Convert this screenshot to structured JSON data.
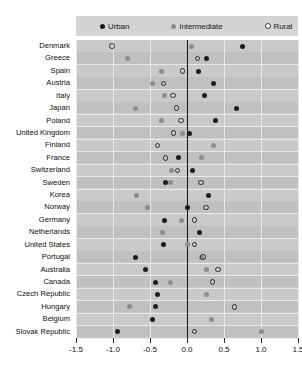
{
  "legend": {
    "items": [
      {
        "label": "Urban",
        "marker": "filled-dark-circle",
        "color": "#1a1a1a"
      },
      {
        "label": "Intermediate",
        "marker": "filled-gray-circle",
        "color": "#8f8f8f"
      },
      {
        "label": "Rural",
        "marker": "open-circle",
        "color": "#ffffff"
      }
    ]
  },
  "chart_data": {
    "type": "scatter",
    "title": "",
    "subtitle": "",
    "xlabel": "",
    "ylabel": "",
    "xlim": [
      -1.5,
      1.5
    ],
    "xticks": [
      -1.5,
      -1.0,
      -0.5,
      0.0,
      0.5,
      1.0,
      1.5
    ],
    "xticklabels": [
      "-1.5",
      "-1.0",
      "-0.5",
      "0.0",
      "0.5",
      "1.0",
      "1.5"
    ],
    "grid": true,
    "legend_position": "top",
    "zero_reference_line": 0.0,
    "categories": [
      "Denmark",
      "Greece",
      "Spain",
      "Austria",
      "Italy",
      "Japan",
      "Poland",
      "United Kingdom",
      "Finland",
      "France",
      "Switzerland",
      "Sweden",
      "Korea",
      "Norway",
      "Germany",
      "Netherlands",
      "United States",
      "Portugal",
      "Australia",
      "Canada",
      "Czech Republic",
      "Hungary",
      "Belgium",
      "Slovak Republic"
    ],
    "series": [
      {
        "name": "Urban",
        "marker": "filled-dark-circle",
        "color": "#1c1c1c",
        "values": [
          0.75,
          0.27,
          0.15,
          0.36,
          0.24,
          0.67,
          0.38,
          0.03,
          null,
          -0.11,
          0.08,
          -0.29,
          0.29,
          0.0,
          -0.31,
          0.17,
          -0.32,
          -0.7,
          -0.56,
          -0.43,
          -0.4,
          -0.43,
          -0.47,
          -0.94
        ]
      },
      {
        "name": "Intermediate",
        "marker": "filled-gray-circle",
        "color": "#8d8d8d",
        "values": [
          0.06,
          -0.81,
          -0.35,
          -0.47,
          -0.31,
          -0.69,
          -0.35,
          -0.06,
          0.36,
          0.19,
          -0.21,
          -0.22,
          -0.68,
          -0.54,
          -0.08,
          -0.33,
          0.01,
          0.2,
          0.26,
          -0.22,
          0.26,
          -0.78,
          0.33,
          1.0
        ]
      },
      {
        "name": "Rural",
        "marker": "open-circle",
        "color": "#2b2b2b",
        "values": [
          -1.01,
          0.14,
          -0.06,
          -0.32,
          -0.19,
          -0.14,
          -0.08,
          -0.18,
          -0.4,
          -0.29,
          -0.13,
          0.19,
          null,
          0.26,
          0.1,
          null,
          0.1,
          0.22,
          0.42,
          0.35,
          null,
          0.64,
          null,
          0.1
        ]
      }
    ]
  }
}
